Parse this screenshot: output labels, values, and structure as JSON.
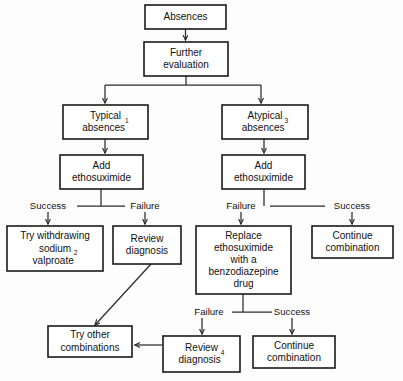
{
  "diagram": {
    "type": "flowchart",
    "orientation": "top-down",
    "colors": {
      "background": "#fdfdfd",
      "box_fill": "#ffffff",
      "box_stroke": "#1a1a1a",
      "connector": "#2b2b2b",
      "text": "#111111"
    },
    "nodes": [
      {
        "id": "absences",
        "lines": [
          "Absences"
        ],
        "superscript": "",
        "x": 145,
        "y": 5,
        "w": 81,
        "h": 24
      },
      {
        "id": "further-evaluation",
        "lines": [
          "Further",
          "evaluation"
        ],
        "superscript": "",
        "x": 144,
        "y": 42,
        "w": 84,
        "h": 34
      },
      {
        "id": "typical-absences",
        "lines": [
          "Typical",
          "absences"
        ],
        "superscript": "1",
        "x": 63,
        "y": 105,
        "w": 85,
        "h": 34
      },
      {
        "id": "atypical-absences",
        "lines": [
          "Atypical",
          "absences"
        ],
        "superscript": "3",
        "x": 222,
        "y": 105,
        "w": 86,
        "h": 34
      },
      {
        "id": "add-ethosuximide-left",
        "lines": [
          "Add",
          "ethosuximide"
        ],
        "superscript": "",
        "x": 60,
        "y": 155,
        "w": 83,
        "h": 34
      },
      {
        "id": "add-ethosuximide-right",
        "lines": [
          "Add",
          "ethosuximide"
        ],
        "superscript": "",
        "x": 222,
        "y": 155,
        "w": 83,
        "h": 34
      },
      {
        "id": "try-withdrawing-sodium-valproate",
        "lines": [
          "Try withdrawing",
          "sodium",
          "valproate"
        ],
        "superscript": "2",
        "x": 7,
        "y": 226,
        "w": 96,
        "h": 45
      },
      {
        "id": "review-diagnosis-upper",
        "lines": [
          "Review",
          "diagnosis"
        ],
        "superscript": "",
        "x": 113,
        "y": 226,
        "w": 68,
        "h": 38
      },
      {
        "id": "replace-ethosuximide",
        "lines": [
          "Replace",
          "ethosuximide",
          "with a",
          "benzodiazepine",
          "drug"
        ],
        "superscript": "",
        "x": 196,
        "y": 226,
        "w": 95,
        "h": 68
      },
      {
        "id": "continue-combination-upper",
        "lines": [
          "Continue",
          "combination"
        ],
        "superscript": "",
        "x": 312,
        "y": 226,
        "w": 81,
        "h": 32
      },
      {
        "id": "try-other-combinations",
        "lines": [
          "Try other",
          "combinations"
        ],
        "superscript": "",
        "x": 48,
        "y": 326,
        "w": 84,
        "h": 31
      },
      {
        "id": "review-diagnosis-lower",
        "lines": [
          "Review",
          "diagnosis"
        ],
        "superscript": "4",
        "x": 163,
        "y": 336,
        "w": 77,
        "h": 36
      },
      {
        "id": "continue-combination-lower",
        "lines": [
          "Continue",
          "combination"
        ],
        "superscript": "",
        "x": 253,
        "y": 336,
        "w": 82,
        "h": 32
      }
    ],
    "edge_labels": [
      {
        "id": "left-success",
        "text": "Success",
        "x": 48,
        "y": 206
      },
      {
        "id": "left-failure",
        "text": "Failure",
        "x": 145,
        "y": 206
      },
      {
        "id": "right-failure",
        "text": "Failure",
        "x": 241,
        "y": 206
      },
      {
        "id": "right-success",
        "text": "Success",
        "x": 352,
        "y": 206
      },
      {
        "id": "lower-failure",
        "text": "Failure",
        "x": 209,
        "y": 312
      },
      {
        "id": "lower-success",
        "text": "Success",
        "x": 292,
        "y": 312
      }
    ]
  }
}
